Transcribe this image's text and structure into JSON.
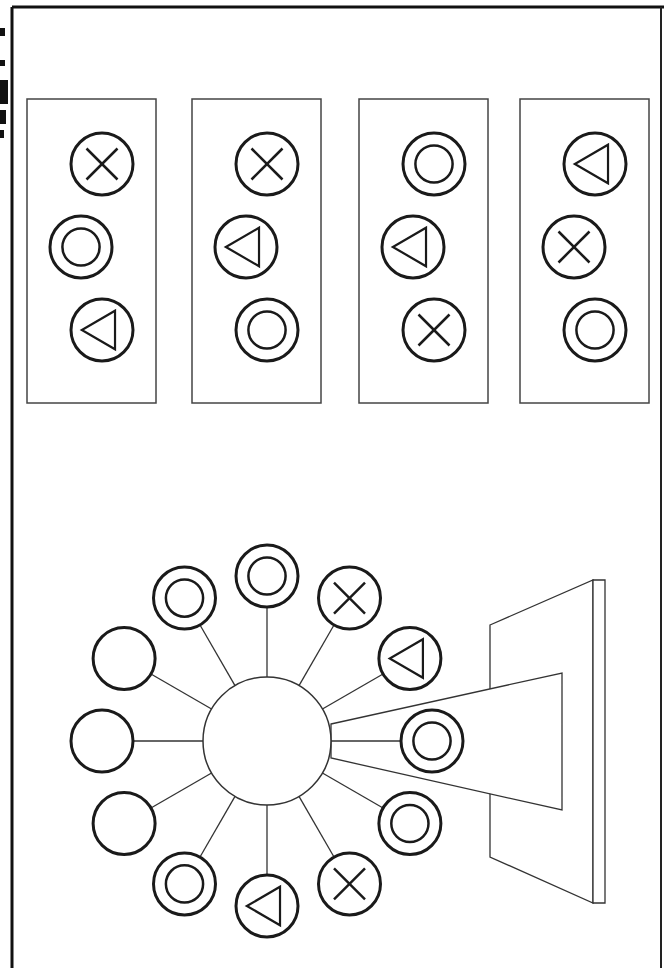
{
  "figure": {
    "caption": "Puzzle: which panel shows the correct order of symbols on the display?",
    "edge_text_note": "cropped rotated label at left edge (illegible)",
    "colors": {
      "stroke": "#1a1a1a",
      "thin_stroke": "#333333",
      "background": "#ffffff",
      "frame": "#111111"
    }
  },
  "panels": [
    {
      "label": "option-1",
      "x": 27,
      "symbols": [
        "cross",
        "double-circle",
        "triangle"
      ]
    },
    {
      "label": "option-2",
      "x": 192,
      "symbols": [
        "cross",
        "triangle",
        "double-circle"
      ]
    },
    {
      "label": "option-3",
      "x": 359,
      "symbols": [
        "double-circle",
        "triangle",
        "cross"
      ]
    },
    {
      "label": "option-4",
      "x": 520,
      "symbols": [
        "triangle",
        "cross",
        "double-circle"
      ]
    }
  ],
  "wheel": {
    "hub": {
      "cx": 267,
      "cy": 741,
      "r": 64
    },
    "spoke_radius": 165,
    "node_radius": 31,
    "nodes": [
      {
        "angle": 0,
        "symbol": "double-circle",
        "note": "projected node"
      },
      {
        "angle": -30,
        "symbol": "triangle"
      },
      {
        "angle": -60,
        "symbol": "cross"
      },
      {
        "angle": -90,
        "symbol": "double-circle"
      },
      {
        "angle": -120,
        "symbol": "double-circle"
      },
      {
        "angle": -150,
        "symbol": "empty"
      },
      {
        "angle": 180,
        "symbol": "empty"
      },
      {
        "angle": 150,
        "symbol": "empty"
      },
      {
        "angle": 120,
        "symbol": "double-circle"
      },
      {
        "angle": 90,
        "symbol": "triangle"
      },
      {
        "angle": 60,
        "symbol": "cross"
      },
      {
        "angle": 30,
        "symbol": "double-circle"
      }
    ]
  },
  "screen": {
    "back_panel": [
      [
        490,
        625
      ],
      [
        593,
        580
      ],
      [
        593,
        903
      ],
      [
        490,
        857
      ]
    ],
    "edge": [
      [
        593,
        580
      ],
      [
        605,
        580
      ],
      [
        605,
        903
      ],
      [
        593,
        903
      ]
    ],
    "beam": [
      [
        331,
        724
      ],
      [
        562,
        673
      ],
      [
        562,
        810
      ],
      [
        331,
        758
      ]
    ]
  }
}
